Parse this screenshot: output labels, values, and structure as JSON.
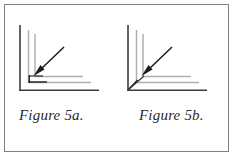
{
  "panel": {
    "border_color": "#808080",
    "background_color": "#ffffff"
  },
  "figures": [
    {
      "id": "figure-5a",
      "caption": "Figure 5a.",
      "drawing": {
        "type": "corner-joint-diagram",
        "description": "Right-angle corner formed by an outer dark L-profile with two lighter parallel offset lines inside; a small dark square inner corner is present where the inner lines meet. A diagonal arrow points down-left toward the inner corner.",
        "outer_line_color": "#3c3c3c",
        "inner_line_color": "#b0b0b0",
        "accent_line_color": "#2a2a2a",
        "arrow_color": "#1c1c1c",
        "annotation_target": "inner-corner",
        "corner_style": "square"
      }
    },
    {
      "id": "figure-5b",
      "caption": "Figure 5b.",
      "drawing": {
        "type": "corner-joint-diagram",
        "description": "Right-angle corner formed by an outer dark L-profile with two lighter parallel offset lines inside; the inner lines meet at a mitred diagonal at the outer corner. A diagonal arrow points down-left toward the mitred outer corner.",
        "outer_line_color": "#3c3c3c",
        "inner_line_color": "#b0b0b0",
        "accent_line_color": "#2a2a2a",
        "arrow_color": "#1c1c1c",
        "annotation_target": "outer-mitred-corner",
        "corner_style": "mitred"
      }
    }
  ]
}
